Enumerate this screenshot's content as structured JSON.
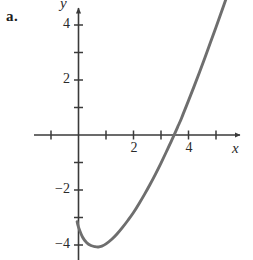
{
  "figure": {
    "part_label": "a.",
    "background_color": "#ffffff",
    "axis_color": "#3a3a3a",
    "curve_color": "#6e6e6e"
  },
  "chart_data": {
    "type": "line",
    "title": "",
    "xlabel": "x",
    "ylabel": "y",
    "xlim": [
      -1.6,
      6.0
    ],
    "ylim": [
      -4.9,
      4.9
    ],
    "grid": false,
    "legend": null,
    "x_ticks": [
      -1,
      1,
      2,
      3,
      4,
      5
    ],
    "x_tick_labels": [
      "",
      "",
      "2",
      "",
      "4",
      ""
    ],
    "y_ticks": [
      1,
      2,
      3,
      4,
      -1,
      -2,
      -3,
      -4
    ],
    "y_tick_labels": [
      "",
      "2",
      "",
      "4",
      "",
      "-2",
      "",
      "-4"
    ],
    "labeled_x_ticks": [
      {
        "value": 2,
        "label": "2"
      },
      {
        "value": 4,
        "label": "4"
      }
    ],
    "labeled_y_ticks": [
      {
        "value": 4,
        "label": "4"
      },
      {
        "value": 2,
        "label": "2"
      },
      {
        "value": -2,
        "label": "−2"
      },
      {
        "value": -4,
        "label": "−4"
      }
    ],
    "series": [
      {
        "name": "curve",
        "x": [
          -0.05,
          0.0,
          0.15,
          0.3,
          0.45,
          0.6,
          0.72,
          0.85,
          1.0,
          1.2,
          1.4,
          1.6,
          1.8,
          2.0,
          2.2,
          2.4,
          2.6,
          2.8,
          3.0,
          3.2,
          3.4,
          3.6,
          3.7,
          3.8,
          4.0,
          4.2,
          4.4,
          4.6,
          4.8,
          5.0,
          5.2,
          5.4,
          5.6
        ],
        "y": [
          -3.15,
          -3.35,
          -3.72,
          -3.92,
          -4.02,
          -4.06,
          -4.07,
          -4.04,
          -3.96,
          -3.8,
          -3.6,
          -3.36,
          -3.1,
          -2.82,
          -2.5,
          -2.16,
          -1.8,
          -1.42,
          -1.02,
          -0.6,
          -0.17,
          0.28,
          0.5,
          0.75,
          1.25,
          1.76,
          2.28,
          2.82,
          3.37,
          3.92,
          4.48,
          5.05,
          5.6
        ]
      }
    ],
    "notable_points": {
      "y_intercept": {
        "x": 0,
        "y": -3.35
      },
      "minimum": {
        "x": 0.72,
        "y": -4.07
      },
      "x_intercept": {
        "x": 3.7,
        "y": 0
      }
    }
  }
}
